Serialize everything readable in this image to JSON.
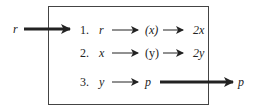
{
  "diagram": {
    "input_label": "r",
    "output_label": "p",
    "steps": [
      {
        "num": "1.",
        "input": "r",
        "middle": "(x)",
        "result": "2x"
      },
      {
        "num": "2.",
        "input": "x",
        "middle": "(y)",
        "result": "2y"
      },
      {
        "num": "3.",
        "input": "y",
        "result": "p"
      }
    ],
    "colors": {
      "stroke": "#222222",
      "box": "#444444",
      "background": "#ffffff"
    }
  }
}
